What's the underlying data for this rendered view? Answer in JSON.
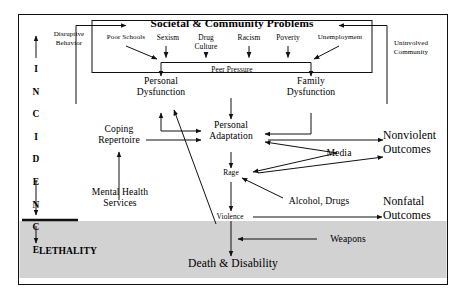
{
  "diagram": {
    "title": "Societal & Community Problems",
    "frame": {
      "border_color": "#111111",
      "background": "#ffffff"
    },
    "band": {
      "label": "LETHALITY",
      "fill": "#d2d2d2"
    },
    "axis": {
      "name": "INCIDENCE",
      "letters": [
        "I",
        "N",
        "C",
        "I",
        "D",
        "E",
        "N",
        "C",
        "E"
      ]
    },
    "nodes": {
      "disruptive_behavior": "Disruptive\nBehavior",
      "disruptive_behavior_l1": "Disruptive",
      "disruptive_behavior_l2": "Behavior",
      "uninvolved_community_l1": "Uninvolved",
      "uninvolved_community_l2": "Community",
      "poor_schools": "Poor Schools",
      "sexism": "Sexism",
      "drug_culture_l1": "Drug",
      "drug_culture_l2": "Culture",
      "racism": "Racism",
      "poverty": "Poverty",
      "unemployment": "Unemployment",
      "peer_pressure": "Peer Pressure",
      "personal_dysfunction_l1": "Personal",
      "personal_dysfunction_l2": "Dysfunction",
      "family_dysfunction_l1": "Family",
      "family_dysfunction_l2": "Dysfunction",
      "coping_repertoire_l1": "Coping",
      "coping_repertoire_l2": "Repertoire",
      "personal_adaptation_l1": "Personal",
      "personal_adaptation_l2": "Adaptation",
      "media": "Media",
      "nonviolent_outcomes_l1": "Nonviolent",
      "nonviolent_outcomes_l2": "Outcomes",
      "rage": "Rage",
      "mental_health_services_l1": "Mental Health",
      "mental_health_services_l2": "Services",
      "alcohol_drugs": "Alcohol, Drugs",
      "nonfatal_outcomes_l1": "Nonfatal",
      "nonfatal_outcomes_l2": "Outcomes",
      "violence": "Violence",
      "weapons": "Weapons",
      "death_disability": "Death & Disability",
      "lethality": "LETHALITY"
    }
  }
}
